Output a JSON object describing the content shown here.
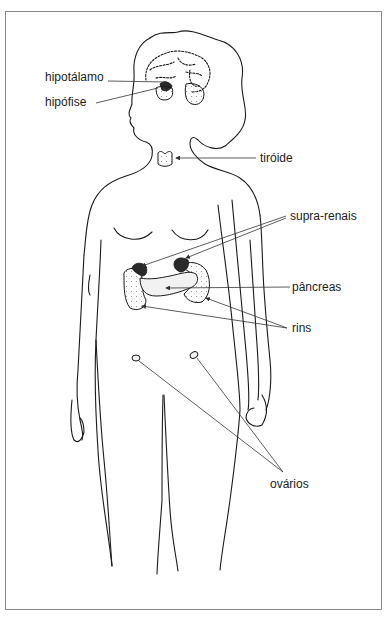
{
  "figure": {
    "type": "anatomical diagram - female endocrine system",
    "labels": {
      "hipotalamo": "hipotálamo",
      "hipofise": "hipófise",
      "tiroide": "tiróide",
      "supra_renais": "supra-renais",
      "pancreas": "pâncreas",
      "rins": "rins",
      "ovarios": "ovários"
    },
    "colors": {
      "line": "#1a1a1a",
      "frame": "#8a8a8a",
      "background": "#ffffff"
    }
  }
}
